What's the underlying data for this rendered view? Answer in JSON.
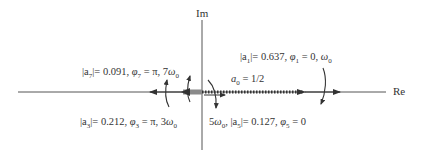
{
  "diagram": {
    "axes": {
      "real_label": "Re",
      "imag_label": "Im"
    },
    "colors": {
      "axis": "#555555",
      "vector": "#333333",
      "bar": "#8a8a8a",
      "text": "#333333"
    },
    "phasors": [
      {
        "id": "a0",
        "label": "a0 = 1/2",
        "magnitude": 0.5,
        "phase": "0",
        "frequency": "0"
      },
      {
        "id": "a1",
        "label": "|a1| = 0.637, φ1 = 0, ω0",
        "magnitude": 0.637,
        "phase": "0",
        "frequency": "ω0"
      },
      {
        "id": "a3",
        "label": "|a3| = 0.212, φ3 = π, 3ω0",
        "magnitude": 0.212,
        "phase": "π",
        "frequency": "3ω0"
      },
      {
        "id": "a5",
        "label": "5ω0, |a5| = 0.127, φ5 = 0",
        "magnitude": 0.127,
        "phase": "0",
        "frequency": "5ω0"
      },
      {
        "id": "a7",
        "label": "|a7| = 0.091, φ7 = π, 7ω0",
        "magnitude": 0.091,
        "phase": "π",
        "frequency": "7ω0"
      }
    ],
    "labels": {
      "a0": {
        "lhs": "a",
        "sub": "0",
        "rhs": " = 1/2"
      },
      "a1": {
        "mag_l": "|a",
        "sub": "1",
        "mag_r": "|= 0.637, ",
        "phi": "φ",
        "phi_sub": "1",
        "phi_val": " = 0, ",
        "freq": "ω",
        "freq_sub": "0"
      },
      "a3": {
        "mag_l": "|a",
        "sub": "3",
        "mag_r": "|= 0.212, ",
        "phi": "φ",
        "phi_sub": "3",
        "phi_val": " = π, 3",
        "freq": "ω",
        "freq_sub": "0"
      },
      "a5": {
        "pre": "5",
        "freq": "ω",
        "freq_sub": "0",
        "sep": ", ",
        "mag_l": "|a",
        "sub": "5",
        "mag_r": "|= 0.127, ",
        "phi": "φ",
        "phi_sub": "5",
        "phi_val": " = 0"
      },
      "a7": {
        "mag_l": "|a",
        "sub": "7",
        "mag_r": "|= 0.091, ",
        "phi": "φ",
        "phi_sub": "7",
        "phi_val": " = π, 7",
        "freq": "ω",
        "freq_sub": "0"
      }
    }
  }
}
